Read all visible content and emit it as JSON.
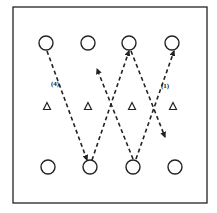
{
  "diagram": {
    "frame": {
      "x": 13,
      "y": 7,
      "width": 194,
      "height": 196,
      "stroke": "#222222"
    },
    "top_circles": [
      {
        "cx": 46,
        "cy": 43
      },
      {
        "cx": 88,
        "cy": 43
      },
      {
        "cx": 129,
        "cy": 43
      },
      {
        "cx": 172,
        "cy": 43
      }
    ],
    "triangles": [
      {
        "cx": 47,
        "cy": 106
      },
      {
        "cx": 88,
        "cy": 106
      },
      {
        "cx": 132,
        "cy": 106
      },
      {
        "cx": 173,
        "cy": 106
      }
    ],
    "bottom_circles": [
      {
        "cx": 48,
        "cy": 167
      },
      {
        "cx": 90,
        "cy": 167
      },
      {
        "cx": 133,
        "cy": 167
      },
      {
        "cx": 175,
        "cy": 167
      }
    ],
    "paths": [
      {
        "from": [
          47,
          51
        ],
        "to": [
          87,
          160
        ],
        "arrow": "end"
      },
      {
        "from": [
          92,
          160
        ],
        "to": [
          129,
          51
        ],
        "arrow": "end"
      },
      {
        "from": [
          131,
          51
        ],
        "to": [
          165,
          137
        ],
        "arrow": "end"
      },
      {
        "from": [
          136,
          159
        ],
        "to": [
          174,
          51
        ],
        "arrow": "end"
      },
      {
        "from": [
          133,
          159
        ],
        "to": [
          97,
          69
        ],
        "arrow": "end"
      }
    ],
    "labels": [
      {
        "text": "(4)",
        "x": 51,
        "y": 86
      },
      {
        "text": "(1)",
        "x": 161,
        "y": 88
      }
    ]
  }
}
